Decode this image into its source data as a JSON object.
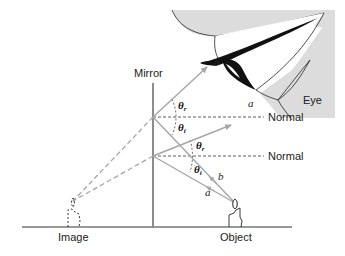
{
  "labels": {
    "mirror": "Mirror",
    "eye": "Eye",
    "image": "Image",
    "object": "Object",
    "normal_upper": "Normal",
    "normal_lower": "Normal",
    "ray_b_upper": "b",
    "ray_a_upper": "a",
    "ray_b_lower": "b",
    "ray_a_lower": "a",
    "theta": "θ",
    "sub_r": "r",
    "sub_i": "i"
  },
  "colors": {
    "ray": "#a6a6a6",
    "mirror": "#8c8c8c",
    "eye_skin": "#dcdcdc",
    "ground": "#333333",
    "dashed": "#333333"
  }
}
